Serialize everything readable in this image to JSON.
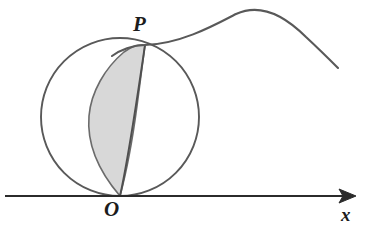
{
  "figure": {
    "type": "geometry-diagram",
    "width": 377,
    "height": 231,
    "background_color": "#ffffff",
    "stroke_color": "#595959",
    "axis_color": "#2b2b2b",
    "shaded_fill_color": "#d8d8d8",
    "shaded_stroke_color": "#6b6b6b"
  },
  "labels": {
    "point_P": "P",
    "point_O": "O",
    "axis_x": "x"
  },
  "points": {
    "P": {
      "x": 145,
      "y": 45,
      "label": "P"
    },
    "O": {
      "x": 120,
      "y": 196,
      "label": "O"
    }
  },
  "circle": {
    "center_x": 120,
    "center_y": 117,
    "radius": 79,
    "tangent_point": "O"
  },
  "axis": {
    "y": 196,
    "x_start": 5,
    "x_end": 355,
    "arrow": true,
    "label": "x"
  },
  "curve": {
    "name": "cycloid-arc",
    "description": "arc rising from P to a peak then descending to the right",
    "start": {
      "x": 145,
      "y": 45
    },
    "peak": {
      "x": 236,
      "y": 13
    },
    "end": {
      "x": 338,
      "y": 68
    }
  },
  "shaded_region": {
    "name": "lens-region",
    "description": "leaf shaped region between the chord OP and a leftward bulging arc",
    "chord_from": "O",
    "chord_to": "P",
    "leftmost_x": 88
  },
  "chord_data": {
    "type": "line",
    "from": {
      "x": 120,
      "y": 196
    },
    "to": {
      "x": 145,
      "y": 45
    }
  }
}
